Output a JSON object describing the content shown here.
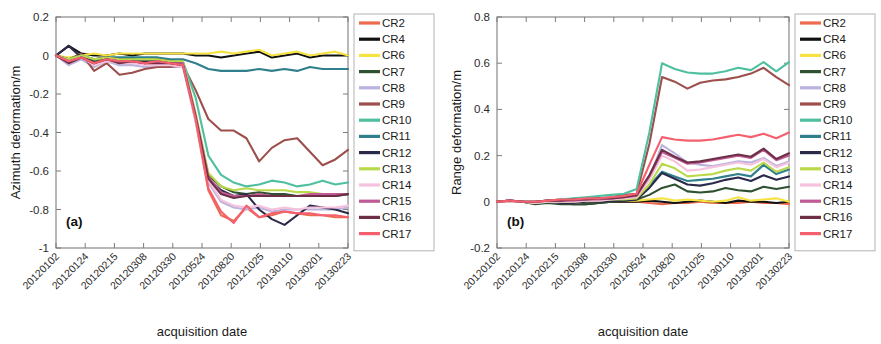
{
  "figure": {
    "width": 881,
    "height": 344,
    "background": "#ffffff"
  },
  "series_colors": {
    "CR2": "#ee6a4f",
    "CR4": "#111111",
    "CR6": "#f6e342",
    "CR7": "#2f5131",
    "CR8": "#b9b3dd",
    "CR9": "#9c4f4c",
    "CR10": "#4fbfa0",
    "CR11": "#2f7f8c",
    "CR12": "#2b2a4a",
    "CR13": "#b9d94a",
    "CR14": "#f6c2dc",
    "CR15": "#c05b96",
    "CR16": "#6d2f46",
    "CR17": "#f4606e"
  },
  "legend": {
    "entries": [
      "CR2",
      "CR4",
      "CR6",
      "CR7",
      "CR8",
      "CR9",
      "CR10",
      "CR11",
      "CR12",
      "CR13",
      "CR14",
      "CR15",
      "CR16",
      "CR17"
    ]
  },
  "x_tick_labels": [
    "20120102",
    "20120124",
    "20120215",
    "20120308",
    "20120330",
    "20120524",
    "20120820",
    "20121025",
    "20130110",
    "20130201",
    "20130223"
  ],
  "chart_data": [
    {
      "id": "panel-a",
      "type": "line",
      "panel_tag": "(a)",
      "title": "",
      "xlabel": "acquisition date",
      "ylabel": "Azimuth deformation/m",
      "ylim": [
        -1,
        0.2
      ],
      "ytick_labels": [
        "0.2",
        "0",
        "-0.2",
        "-0.4",
        "-0.6",
        "-0.8",
        "-1"
      ],
      "ytick_values": [
        0.2,
        0,
        -0.2,
        -0.4,
        -0.6,
        -0.8,
        -1
      ],
      "grid": false,
      "legend_position": "right",
      "x": [
        "20120102",
        "20120113",
        "20120124",
        "20120204",
        "20120215",
        "20120226",
        "20120308",
        "20120319",
        "20120330",
        "20120427",
        "20120524",
        "20120620",
        "20120716",
        "20120820",
        "20120916",
        "20121012",
        "20121025",
        "20121120",
        "20121216",
        "20130110",
        "20130125",
        "20130201",
        "20130212",
        "20130223"
      ],
      "series": [
        {
          "name": "CR2",
          "values": [
            0.0,
            -0.04,
            -0.01,
            -0.03,
            -0.01,
            -0.02,
            -0.02,
            -0.03,
            -0.03,
            -0.04,
            -0.05,
            -0.34,
            -0.7,
            -0.83,
            -0.86,
            -0.79,
            -0.84,
            -0.83,
            -0.81,
            -0.82,
            -0.83,
            -0.83,
            -0.84,
            -0.84
          ]
        },
        {
          "name": "CR4",
          "values": [
            0.0,
            0.05,
            0.01,
            0.0,
            0.0,
            0.01,
            0.0,
            0.01,
            0.01,
            0.01,
            0.01,
            0.0,
            0.0,
            -0.01,
            0.0,
            0.01,
            0.02,
            -0.01,
            0.0,
            0.01,
            -0.01,
            0.0,
            0.0,
            0.0
          ]
        },
        {
          "name": "CR6",
          "values": [
            0.0,
            -0.01,
            0.0,
            0.01,
            0.0,
            0.01,
            0.01,
            0.01,
            0.01,
            0.01,
            0.01,
            0.01,
            0.01,
            0.02,
            0.01,
            0.02,
            0.03,
            0.0,
            0.01,
            0.02,
            0.0,
            0.01,
            0.02,
            0.0
          ]
        },
        {
          "name": "CR7",
          "values": [
            0.0,
            -0.03,
            -0.01,
            -0.03,
            -0.02,
            -0.03,
            -0.03,
            -0.04,
            -0.04,
            -0.05,
            -0.05,
            -0.32,
            -0.62,
            -0.68,
            -0.71,
            -0.72,
            -0.71,
            -0.72,
            -0.72,
            -0.73,
            -0.73,
            -0.72,
            -0.73,
            -0.72
          ]
        },
        {
          "name": "CR8",
          "values": [
            0.0,
            -0.05,
            -0.02,
            -0.06,
            -0.03,
            -0.05,
            -0.05,
            -0.06,
            -0.06,
            -0.06,
            -0.06,
            -0.34,
            -0.66,
            -0.76,
            -0.79,
            -0.8,
            -0.79,
            -0.81,
            -0.8,
            -0.8,
            -0.8,
            -0.8,
            -0.8,
            -0.79
          ]
        },
        {
          "name": "CR9",
          "values": [
            0.0,
            -0.02,
            0.01,
            -0.08,
            -0.04,
            -0.1,
            -0.09,
            -0.07,
            -0.06,
            -0.06,
            -0.05,
            -0.18,
            -0.33,
            -0.39,
            -0.39,
            -0.43,
            -0.55,
            -0.48,
            -0.44,
            -0.43,
            -0.5,
            -0.57,
            -0.54,
            -0.49
          ]
        },
        {
          "name": "CR10",
          "values": [
            0.0,
            -0.02,
            0.0,
            -0.02,
            -0.01,
            -0.02,
            -0.02,
            -0.02,
            -0.02,
            -0.03,
            -0.03,
            -0.22,
            -0.52,
            -0.62,
            -0.66,
            -0.68,
            -0.67,
            -0.65,
            -0.66,
            -0.68,
            -0.67,
            -0.65,
            -0.67,
            -0.66
          ]
        },
        {
          "name": "CR11",
          "values": [
            0.0,
            -0.02,
            0.0,
            -0.02,
            -0.01,
            -0.01,
            -0.01,
            -0.01,
            -0.01,
            -0.02,
            -0.02,
            -0.04,
            -0.07,
            -0.08,
            -0.08,
            -0.08,
            -0.07,
            -0.08,
            -0.07,
            -0.08,
            -0.06,
            -0.07,
            -0.07,
            -0.07
          ]
        },
        {
          "name": "CR12",
          "values": [
            0.0,
            0.05,
            -0.01,
            -0.02,
            -0.01,
            -0.02,
            -0.02,
            -0.03,
            -0.02,
            -0.03,
            -0.04,
            -0.32,
            -0.64,
            -0.7,
            -0.73,
            -0.72,
            -0.8,
            -0.85,
            -0.88,
            -0.83,
            -0.78,
            -0.79,
            -0.8,
            -0.82
          ]
        },
        {
          "name": "CR13",
          "values": [
            0.0,
            -0.02,
            0.0,
            -0.02,
            -0.01,
            -0.02,
            -0.02,
            -0.02,
            -0.02,
            -0.03,
            -0.03,
            -0.3,
            -0.61,
            -0.68,
            -0.7,
            -0.69,
            -0.7,
            -0.7,
            -0.7,
            -0.71,
            -0.71,
            -0.72,
            -0.72,
            -0.72
          ]
        },
        {
          "name": "CR14",
          "values": [
            0.0,
            -0.04,
            -0.01,
            -0.05,
            -0.03,
            -0.04,
            -0.04,
            -0.05,
            -0.05,
            -0.05,
            -0.06,
            -0.33,
            -0.65,
            -0.75,
            -0.78,
            -0.79,
            -0.78,
            -0.8,
            -0.79,
            -0.8,
            -0.79,
            -0.79,
            -0.79,
            -0.78
          ]
        },
        {
          "name": "CR15",
          "values": [
            0.0,
            -0.03,
            -0.01,
            -0.04,
            -0.02,
            -0.03,
            -0.03,
            -0.04,
            -0.03,
            -0.04,
            -0.04,
            -0.31,
            -0.63,
            -0.71,
            -0.73,
            -0.73,
            -0.72,
            -0.73,
            -0.73,
            -0.73,
            -0.72,
            -0.72,
            -0.72,
            -0.72
          ]
        },
        {
          "name": "CR16",
          "values": [
            0.0,
            -0.04,
            -0.01,
            -0.04,
            -0.02,
            -0.04,
            -0.03,
            -0.04,
            -0.04,
            -0.04,
            -0.05,
            -0.32,
            -0.64,
            -0.72,
            -0.74,
            -0.73,
            -0.73,
            -0.73,
            -0.73,
            -0.73,
            -0.73,
            -0.73,
            -0.73,
            -0.72
          ]
        },
        {
          "name": "CR17",
          "values": [
            0.0,
            -0.03,
            -0.01,
            -0.04,
            -0.02,
            -0.03,
            -0.03,
            -0.04,
            -0.03,
            -0.04,
            -0.05,
            -0.33,
            -0.69,
            -0.81,
            -0.87,
            -0.78,
            -0.84,
            -0.82,
            -0.81,
            -0.82,
            -0.82,
            -0.83,
            -0.83,
            -0.84
          ]
        }
      ]
    },
    {
      "id": "panel-b",
      "type": "line",
      "panel_tag": "(b)",
      "title": "",
      "xlabel": "acquisition date",
      "ylabel": "Range deformation/m",
      "ylim": [
        -0.2,
        0.8
      ],
      "ytick_labels": [
        "0.8",
        "0.6",
        "0.4",
        "0.2",
        "0",
        "-0.2"
      ],
      "ytick_values": [
        0.8,
        0.6,
        0.4,
        0.2,
        0,
        -0.2
      ],
      "grid": false,
      "legend_position": "right",
      "x": [
        "20120102",
        "20120113",
        "20120124",
        "20120204",
        "20120215",
        "20120226",
        "20120308",
        "20120319",
        "20120330",
        "20120427",
        "20120524",
        "20120620",
        "20120716",
        "20120820",
        "20120916",
        "20121012",
        "20121025",
        "20121120",
        "20121216",
        "20130110",
        "20130125",
        "20130201",
        "20130212",
        "20130223"
      ],
      "series": [
        {
          "name": "CR2",
          "values": [
            0.0,
            0.0,
            0.0,
            -0.005,
            0.0,
            -0.005,
            -0.005,
            -0.005,
            0.0,
            0.0,
            0.0,
            0.0,
            -0.005,
            -0.01,
            -0.005,
            -0.005,
            0.0,
            -0.005,
            -0.005,
            -0.005,
            0.0,
            -0.005,
            -0.005,
            -0.01
          ]
        },
        {
          "name": "CR4",
          "values": [
            0.0,
            0.005,
            0.0,
            -0.005,
            0.0,
            -0.005,
            -0.01,
            -0.01,
            -0.005,
            0.0,
            0.0,
            0.0,
            0.005,
            0.0,
            -0.005,
            0.0,
            0.005,
            0.0,
            -0.005,
            0.005,
            0.0,
            0.0,
            -0.005,
            0.0
          ]
        },
        {
          "name": "CR6",
          "values": [
            0.0,
            0.0,
            0.0,
            -0.005,
            0.0,
            0.0,
            -0.005,
            -0.005,
            0.0,
            0.005,
            0.005,
            0.005,
            0.01,
            0.015,
            0.005,
            0.01,
            0.005,
            0.0,
            0.005,
            0.02,
            0.005,
            0.01,
            0.015,
            0.0
          ]
        },
        {
          "name": "CR7",
          "values": [
            0.0,
            0.0,
            0.0,
            -0.01,
            -0.005,
            -0.01,
            -0.01,
            -0.01,
            -0.005,
            0.0,
            0.005,
            0.01,
            0.03,
            0.06,
            0.075,
            0.045,
            0.04,
            0.045,
            0.06,
            0.05,
            0.045,
            0.065,
            0.055,
            0.065
          ]
        },
        {
          "name": "CR8",
          "values": [
            0.0,
            0.0,
            0.0,
            -0.005,
            0.0,
            -0.005,
            -0.005,
            0.0,
            0.005,
            0.01,
            0.015,
            0.02,
            0.105,
            0.245,
            0.21,
            0.17,
            0.16,
            0.155,
            0.165,
            0.175,
            0.17,
            0.19,
            0.155,
            0.175
          ]
        },
        {
          "name": "CR9",
          "values": [
            0.0,
            0.005,
            0.0,
            0.0,
            0.005,
            0.01,
            0.01,
            0.015,
            0.015,
            0.02,
            0.03,
            0.035,
            0.25,
            0.54,
            0.52,
            0.49,
            0.515,
            0.525,
            0.53,
            0.54,
            0.555,
            0.58,
            0.54,
            0.505
          ]
        },
        {
          "name": "CR10",
          "values": [
            0.0,
            0.005,
            0.0,
            0.0,
            0.005,
            0.01,
            0.015,
            0.02,
            0.025,
            0.03,
            0.035,
            0.055,
            0.3,
            0.6,
            0.575,
            0.56,
            0.555,
            0.555,
            0.565,
            0.58,
            0.57,
            0.605,
            0.565,
            0.605
          ]
        },
        {
          "name": "CR11",
          "values": [
            0.0,
            0.0,
            0.0,
            -0.005,
            0.0,
            0.0,
            0.0,
            0.005,
            0.005,
            0.01,
            0.01,
            0.015,
            0.07,
            0.13,
            0.11,
            0.09,
            0.095,
            0.1,
            0.11,
            0.12,
            0.11,
            0.16,
            0.12,
            0.14
          ]
        },
        {
          "name": "CR12",
          "values": [
            0.0,
            0.0,
            0.0,
            -0.005,
            0.0,
            -0.005,
            -0.005,
            0.0,
            0.0,
            0.005,
            0.005,
            0.01,
            0.06,
            0.125,
            0.1,
            0.075,
            0.07,
            0.08,
            0.095,
            0.105,
            0.09,
            0.115,
            0.095,
            0.11
          ]
        },
        {
          "name": "CR13",
          "values": [
            0.0,
            0.0,
            0.0,
            -0.005,
            0.0,
            0.0,
            0.0,
            0.005,
            0.005,
            0.01,
            0.01,
            0.015,
            0.075,
            0.165,
            0.145,
            0.11,
            0.115,
            0.12,
            0.135,
            0.145,
            0.135,
            0.17,
            0.13,
            0.15
          ]
        },
        {
          "name": "CR14",
          "values": [
            0.0,
            0.0,
            0.0,
            -0.005,
            0.0,
            0.0,
            0.0,
            0.005,
            0.005,
            0.01,
            0.015,
            0.02,
            0.095,
            0.2,
            0.175,
            0.135,
            0.14,
            0.15,
            0.16,
            0.17,
            0.16,
            0.185,
            0.15,
            0.17
          ]
        },
        {
          "name": "CR15",
          "values": [
            0.0,
            0.005,
            0.0,
            0.0,
            0.005,
            0.005,
            0.005,
            0.01,
            0.01,
            0.015,
            0.02,
            0.025,
            0.11,
            0.215,
            0.19,
            0.165,
            0.17,
            0.18,
            0.19,
            0.2,
            0.19,
            0.225,
            0.18,
            0.2
          ]
        },
        {
          "name": "CR16",
          "values": [
            0.0,
            0.005,
            0.0,
            0.0,
            0.005,
            0.005,
            0.01,
            0.01,
            0.015,
            0.015,
            0.02,
            0.03,
            0.115,
            0.225,
            0.195,
            0.17,
            0.175,
            0.185,
            0.195,
            0.205,
            0.195,
            0.23,
            0.185,
            0.21
          ]
        },
        {
          "name": "CR17",
          "values": [
            0.0,
            0.005,
            0.0,
            0.0,
            0.005,
            0.01,
            0.01,
            0.015,
            0.015,
            0.02,
            0.025,
            0.035,
            0.16,
            0.28,
            0.27,
            0.265,
            0.265,
            0.27,
            0.28,
            0.29,
            0.28,
            0.295,
            0.275,
            0.3
          ]
        }
      ]
    }
  ]
}
